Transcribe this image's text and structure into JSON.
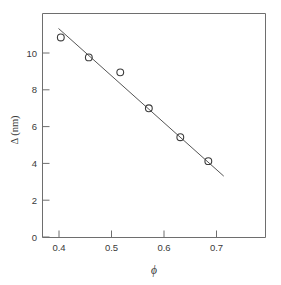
{
  "chart_data": {
    "type": "scatter",
    "title": "",
    "subtitle": "",
    "xlabel": "ϕ",
    "ylabel": "Δ (nm)",
    "xlim": [
      0.355,
      0.745
    ],
    "ylim": [
      0,
      11.2
    ],
    "grid": false,
    "legend": null,
    "xticks": [
      0.4,
      0.5,
      0.6,
      0.7
    ],
    "xtick_labels": [
      "0.4",
      "0.5",
      "0.6",
      "0.7"
    ],
    "yticks": [
      0,
      2,
      4,
      6,
      8,
      10
    ],
    "ytick_labels": [
      "0",
      "2",
      "4",
      "6",
      "8",
      "10"
    ],
    "marker_style": "open-circle",
    "series": [
      {
        "name": "measured",
        "x": [
          0.387,
          0.436,
          0.491,
          0.541,
          0.596,
          0.645
        ],
        "y": [
          10.0,
          9.0,
          8.25,
          6.45,
          5.0,
          3.8
        ]
      },
      {
        "name": "linear fit",
        "type": "line",
        "x": [
          0.383,
          0.672
        ],
        "y": [
          10.45,
          3.05
        ]
      }
    ]
  },
  "axis_labels": {
    "x_title": "ϕ",
    "y_title": "Δ (nm)",
    "x_tick_0": "0.4",
    "x_tick_1": "0.5",
    "x_tick_2": "0.6",
    "x_tick_3": "0.7",
    "y_tick_0": "0",
    "y_tick_1": "2",
    "y_tick_2": "4",
    "y_tick_3": "6",
    "y_tick_4": "8",
    "y_tick_5": "10"
  },
  "colors": {
    "background": "#ffffff",
    "frame": "#6e6e6e",
    "marker": "#3c3c3c",
    "fit_line": "#555555",
    "text": "#3a3a3a"
  }
}
